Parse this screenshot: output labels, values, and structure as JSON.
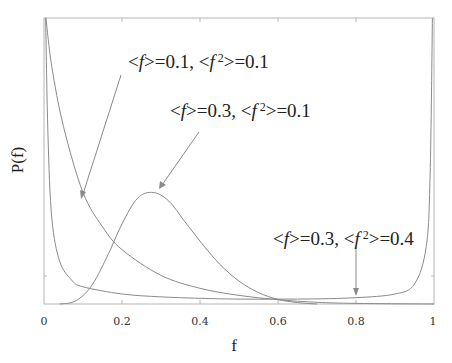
{
  "chart_data": {
    "type": "line",
    "title": "",
    "xlabel": "f",
    "ylabel": "P(f)",
    "xlim": [
      0,
      1
    ],
    "xticks": [
      "0",
      "0.2",
      "0.4",
      "0.6",
      "0.8",
      "1"
    ],
    "xtick_values": [
      0,
      0.2,
      0.4,
      0.6,
      0.8,
      1
    ],
    "grid": false,
    "legend": "none (curves labeled by arrow annotations)",
    "series": [
      {
        "name": "<f>=0.1, <f 2>=0.1",
        "shape": "monotonically decreasing from very high near f=0",
        "x": [
          0.005,
          0.02,
          0.05,
          0.1,
          0.15,
          0.2,
          0.3,
          0.4,
          0.5,
          0.6,
          0.7,
          0.8,
          1.0
        ],
        "y_rel": [
          1.0,
          0.83,
          0.62,
          0.39,
          0.27,
          0.19,
          0.1,
          0.055,
          0.03,
          0.015,
          0.006,
          0.002,
          0.0
        ]
      },
      {
        "name": "<f>=0.3, <f 2>=0.1",
        "shape": "unimodal bell, peak near f≈0.28",
        "x": [
          0.04,
          0.08,
          0.12,
          0.16,
          0.2,
          0.24,
          0.28,
          0.32,
          0.36,
          0.4,
          0.45,
          0.5,
          0.55,
          0.6,
          0.65,
          0.7
        ],
        "y_rel": [
          0.0,
          0.01,
          0.06,
          0.16,
          0.28,
          0.37,
          0.39,
          0.36,
          0.29,
          0.22,
          0.14,
          0.08,
          0.04,
          0.016,
          0.005,
          0.0
        ]
      },
      {
        "name": "<f>=0.3, <f 2>=0.4",
        "shape": "U-shaped, diverging at f=0 and f=1",
        "x": [
          0.004,
          0.01,
          0.02,
          0.04,
          0.07,
          0.1,
          0.2,
          0.3,
          0.4,
          0.5,
          0.6,
          0.7,
          0.8,
          0.9,
          0.95,
          0.98,
          0.99,
          0.996
        ],
        "y_rel": [
          1.0,
          0.6,
          0.3,
          0.15,
          0.085,
          0.06,
          0.035,
          0.025,
          0.02,
          0.017,
          0.017,
          0.018,
          0.022,
          0.035,
          0.07,
          0.2,
          0.45,
          1.0
        ]
      }
    ],
    "annotations": [
      {
        "text_parts": [
          "<",
          "f",
          ">=0.1, <",
          "f",
          " ",
          "2",
          ">=0.1"
        ],
        "arrow_to_f": 0.1
      },
      {
        "text_parts": [
          "<",
          "f",
          ">=0.3, <",
          "f",
          " ",
          "2",
          ">=0.1"
        ],
        "arrow_to_f": 0.3
      },
      {
        "text_parts": [
          "<",
          "f",
          ">=0.3, <",
          "f",
          " ",
          "2",
          ">=0.4"
        ],
        "arrow_to_f": 0.8
      }
    ]
  },
  "labels": {
    "xlabel": "f",
    "ylabel": "P(f)",
    "xticks": [
      "0",
      "0.2",
      "0.4",
      "0.6",
      "0.8",
      "1"
    ],
    "annot1": {
      "a": "<",
      "f1": "f",
      "b": ">=0.1, <",
      "f2": "f",
      "sup": " 2",
      "c": ">=0.1"
    },
    "annot2": {
      "a": "<",
      "f1": "f",
      "b": ">=0.3, <",
      "f2": "f",
      "sup": " 2",
      "c": ">=0.1"
    },
    "annot3": {
      "a": "<",
      "f1": "f",
      "b": ">=0.3, <",
      "f2": "f",
      "sup": " 2",
      "c": ">=0.4"
    }
  }
}
